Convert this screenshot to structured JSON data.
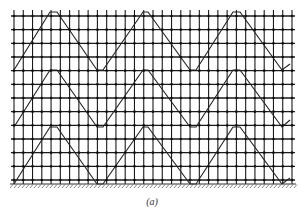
{
  "figure": {
    "caption": "(a)",
    "grid": {
      "x_start": 14,
      "x_end": 292,
      "columns": 31,
      "y_start": 16,
      "y_end": 180,
      "rows": 13,
      "line_color": "#1a1a1a",
      "node_color": "#111111"
    },
    "ground": {
      "y": 184,
      "x_start": 10,
      "x_end": 296,
      "hatch_color": "#555555"
    },
    "bracing": [
      {
        "band": 1,
        "points": [
          [
            14,
            70
          ],
          [
            50,
            12
          ],
          [
            57,
            12
          ],
          [
            97,
            70
          ],
          [
            103,
            70
          ],
          [
            143,
            12
          ],
          [
            148,
            12
          ],
          [
            190,
            70
          ],
          [
            196,
            70
          ],
          [
            233,
            12
          ],
          [
            240,
            12
          ],
          [
            282,
            70
          ],
          [
            290,
            64
          ]
        ]
      },
      {
        "band": 2,
        "points": [
          [
            14,
            127
          ],
          [
            50,
            70
          ],
          [
            57,
            70
          ],
          [
            97,
            127
          ],
          [
            103,
            127
          ],
          [
            143,
            70
          ],
          [
            148,
            70
          ],
          [
            190,
            127
          ],
          [
            196,
            127
          ],
          [
            233,
            70
          ],
          [
            240,
            70
          ],
          [
            282,
            127
          ],
          [
            290,
            120
          ]
        ]
      },
      {
        "band": 3,
        "points": [
          [
            14,
            184
          ],
          [
            50,
            127
          ],
          [
            57,
            127
          ],
          [
            97,
            184
          ],
          [
            103,
            184
          ],
          [
            143,
            127
          ],
          [
            148,
            127
          ],
          [
            190,
            184
          ],
          [
            196,
            184
          ],
          [
            233,
            127
          ],
          [
            240,
            127
          ],
          [
            282,
            184
          ],
          [
            290,
            178
          ]
        ]
      }
    ]
  }
}
